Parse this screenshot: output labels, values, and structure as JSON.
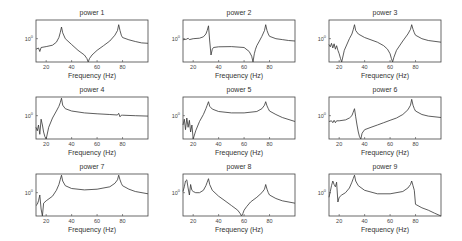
{
  "chart_data": [
    {
      "type": "line",
      "title": "power 1",
      "xlabel": "Frequency (Hz)",
      "ylabel": "",
      "ytick": "10^0",
      "xticks": [
        20,
        40,
        60,
        80
      ],
      "xlim": [
        12,
        100
      ],
      "yscale": "log",
      "x": [
        12,
        14,
        15,
        16,
        20,
        25,
        28,
        30,
        31,
        32,
        33,
        35,
        40,
        45,
        50,
        52,
        53,
        54,
        56,
        60,
        65,
        70,
        74,
        76,
        77,
        78,
        79,
        80,
        85,
        90,
        95,
        100
      ],
      "y": [
        0.55,
        0.6,
        0.45,
        0.62,
        0.66,
        0.72,
        0.85,
        1.05,
        1.25,
        1.5,
        1.25,
        1.0,
        0.75,
        0.5,
        0.3,
        0.15,
        0.0,
        0.15,
        0.3,
        0.5,
        0.7,
        0.9,
        1.15,
        1.35,
        1.6,
        1.35,
        1.15,
        1.05,
        0.95,
        0.88,
        0.82,
        0.8
      ]
    },
    {
      "type": "line",
      "title": "power 2",
      "xlabel": "Frequency (Hz)",
      "ylabel": "",
      "ytick": "10^0",
      "xticks": [
        20,
        40,
        60,
        80
      ],
      "xlim": [
        12,
        100
      ],
      "yscale": "log",
      "x": [
        12,
        15,
        16,
        17,
        20,
        25,
        28,
        30,
        31,
        32,
        33,
        34,
        35,
        36,
        40,
        50,
        60,
        64,
        66,
        67,
        68,
        69,
        70,
        72,
        74,
        76,
        77,
        78,
        79,
        80,
        85,
        90,
        95,
        100
      ],
      "y": [
        0.95,
        0.98,
        1.02,
        0.96,
        1.0,
        1.02,
        1.08,
        1.2,
        1.35,
        1.55,
        0.9,
        0.3,
        0.55,
        0.62,
        0.65,
        0.66,
        0.62,
        0.45,
        0.25,
        0.0,
        0.35,
        0.55,
        0.7,
        0.9,
        1.1,
        1.35,
        1.6,
        1.35,
        1.2,
        1.1,
        1.0,
        0.96,
        0.92,
        0.9
      ]
    },
    {
      "type": "line",
      "title": "power 3",
      "xlabel": "Frequency (Hz)",
      "ylabel": "",
      "ytick": "10^0",
      "xticks": [
        20,
        40,
        60,
        80
      ],
      "xlim": [
        12,
        100
      ],
      "yscale": "log",
      "x": [
        12,
        13,
        14,
        15,
        16,
        17,
        18,
        19,
        20,
        21,
        22,
        24,
        28,
        30,
        31,
        32,
        33,
        35,
        40,
        50,
        55,
        58,
        60,
        61,
        62,
        63,
        65,
        70,
        74,
        76,
        77,
        78,
        79,
        80,
        85,
        90,
        100
      ],
      "y": [
        0.75,
        0.65,
        0.8,
        0.6,
        0.78,
        0.55,
        0.7,
        0.5,
        0.35,
        0.15,
        0.0,
        0.5,
        1.0,
        1.2,
        1.38,
        1.6,
        1.35,
        1.2,
        1.05,
        0.85,
        0.7,
        0.55,
        0.35,
        0.15,
        0.0,
        0.2,
        0.5,
        0.9,
        1.2,
        1.4,
        1.6,
        1.4,
        1.25,
        1.15,
        1.0,
        0.92,
        0.85
      ]
    },
    {
      "type": "line",
      "title": "power 4",
      "xlabel": "Frequency (Hz)",
      "ylabel": "",
      "ytick": "10^0",
      "xticks": [
        20,
        40,
        60,
        80
      ],
      "xlim": [
        12,
        100
      ],
      "yscale": "log",
      "x": [
        12,
        13,
        14,
        15,
        16,
        17,
        18,
        19,
        20,
        22,
        25,
        28,
        30,
        31,
        32,
        33,
        35,
        40,
        50,
        60,
        70,
        76,
        77,
        78,
        79,
        80,
        90,
        100
      ],
      "y": [
        0.5,
        0.35,
        0.6,
        0.2,
        0.85,
        0.6,
        0.3,
        0.1,
        0.0,
        0.5,
        0.9,
        1.2,
        1.4,
        1.55,
        1.75,
        1.45,
        1.3,
        1.2,
        1.12,
        1.08,
        1.05,
        1.03,
        1.1,
        0.95,
        1.02,
        1.02,
        1.0,
        0.98
      ]
    },
    {
      "type": "line",
      "title": "power 5",
      "xlabel": "Frequency (Hz)",
      "ylabel": "",
      "ytick": "10^0",
      "xticks": [
        20,
        40,
        60,
        80
      ],
      "xlim": [
        12,
        100
      ],
      "yscale": "log",
      "x": [
        12,
        13,
        14,
        15,
        16,
        17,
        18,
        19,
        20,
        22,
        25,
        28,
        30,
        31,
        32,
        33,
        35,
        40,
        50,
        60,
        70,
        74,
        76,
        77,
        78,
        79,
        80,
        85,
        90,
        100
      ],
      "y": [
        0.6,
        0.85,
        0.4,
        0.9,
        0.5,
        0.8,
        0.3,
        0.6,
        0.0,
        0.35,
        0.75,
        1.05,
        1.3,
        1.45,
        1.6,
        1.4,
        1.28,
        1.18,
        1.12,
        1.12,
        1.18,
        1.3,
        1.45,
        1.6,
        1.42,
        1.3,
        1.2,
        1.05,
        0.92,
        0.75
      ]
    },
    {
      "type": "line",
      "title": "power 6",
      "xlabel": "Frequency (Hz)",
      "ylabel": "",
      "ytick": "10^0",
      "xticks": [
        20,
        40,
        60,
        80
      ],
      "xlim": [
        12,
        100
      ],
      "yscale": "log",
      "x": [
        12,
        14,
        15,
        16,
        17,
        18,
        20,
        25,
        28,
        30,
        31,
        32,
        33,
        34,
        35,
        36,
        37,
        38,
        40,
        45,
        50,
        55,
        60,
        65,
        70,
        74,
        76,
        77,
        78,
        79,
        80,
        85,
        90,
        100
      ],
      "y": [
        0.75,
        0.78,
        0.7,
        0.8,
        0.7,
        0.78,
        0.78,
        0.82,
        0.9,
        1.0,
        1.15,
        1.3,
        0.95,
        0.6,
        0.3,
        0.1,
        0.0,
        0.25,
        0.4,
        0.5,
        0.6,
        0.7,
        0.8,
        0.9,
        1.05,
        1.25,
        1.45,
        1.7,
        1.45,
        1.3,
        1.2,
        1.05,
        0.98,
        0.92
      ]
    },
    {
      "type": "line",
      "title": "power 7",
      "xlabel": "Frequency (Hz)",
      "ylabel": "",
      "ytick": "10^0",
      "xticks": [
        20,
        40,
        60,
        80
      ],
      "xlim": [
        12,
        100
      ],
      "yscale": "log",
      "x": [
        12,
        13,
        14,
        15,
        16,
        17,
        18,
        20,
        25,
        28,
        30,
        31,
        32,
        33,
        35,
        40,
        50,
        60,
        70,
        74,
        76,
        77,
        78,
        79,
        80,
        85,
        90,
        100
      ],
      "y": [
        0.45,
        0.5,
        0.65,
        0.9,
        0.3,
        0.0,
        0.55,
        0.65,
        0.85,
        1.1,
        1.35,
        1.55,
        1.75,
        1.5,
        1.3,
        1.18,
        1.12,
        1.15,
        1.25,
        1.4,
        1.55,
        1.75,
        1.55,
        1.4,
        1.3,
        1.15,
        1.05,
        0.95
      ]
    },
    {
      "type": "line",
      "title": "power 8",
      "xlabel": "Frequency (Hz)",
      "ylabel": "",
      "ytick": "10^0",
      "xticks": [
        20,
        40,
        60,
        80
      ],
      "xlim": [
        12,
        100
      ],
      "yscale": "log",
      "x": [
        12,
        13,
        14,
        15,
        16,
        17,
        18,
        19,
        20,
        22,
        25,
        28,
        30,
        31,
        32,
        33,
        35,
        40,
        45,
        50,
        55,
        57,
        58,
        59,
        60,
        62,
        65,
        70,
        74,
        76,
        77,
        78,
        79,
        80,
        85,
        90,
        100
      ],
      "y": [
        1.05,
        1.25,
        1.5,
        1.55,
        1.2,
        0.9,
        1.35,
        1.1,
        1.05,
        1.0,
        1.0,
        1.1,
        1.3,
        1.45,
        1.6,
        1.35,
        1.1,
        0.85,
        0.65,
        0.45,
        0.25,
        0.1,
        0.0,
        0.1,
        0.25,
        0.4,
        0.6,
        0.8,
        1.0,
        1.15,
        1.35,
        1.15,
        1.0,
        0.9,
        0.75,
        0.65,
        0.55
      ]
    },
    {
      "type": "line",
      "title": "power 9",
      "xlabel": "Frequency (Hz)",
      "ylabel": "",
      "ytick": "10^0",
      "xticks": [
        20,
        40,
        60,
        80
      ],
      "xlim": [
        12,
        100
      ],
      "yscale": "log",
      "x": [
        12,
        13,
        14,
        15,
        16,
        17,
        18,
        19,
        20,
        22,
        25,
        28,
        30,
        31,
        32,
        33,
        35,
        40,
        50,
        60,
        70,
        74,
        76,
        77,
        78,
        79,
        80,
        85,
        90,
        95,
        100
      ],
      "y": [
        0.8,
        1.05,
        1.3,
        1.5,
        1.35,
        1.25,
        1.45,
        0.6,
        0.8,
        0.9,
        1.0,
        1.2,
        1.45,
        1.6,
        1.75,
        1.5,
        1.3,
        1.1,
        0.95,
        0.95,
        1.05,
        1.2,
        1.35,
        1.5,
        1.3,
        1.1,
        0.5,
        0.35,
        0.25,
        0.12,
        0.0
      ]
    }
  ],
  "panels": [
    {
      "title": "power 1",
      "xlabel": "Frequency (Hz)",
      "ytick": "10",
      "ytick_exp": "0",
      "xticks": [
        "20",
        "40",
        "60",
        "80"
      ]
    },
    {
      "title": "power 2",
      "xlabel": "Frequency (Hz)",
      "ytick": "10",
      "ytick_exp": "0",
      "xticks": [
        "20",
        "40",
        "60",
        "80"
      ]
    },
    {
      "title": "power 3",
      "xlabel": "Frequency (Hz)",
      "ytick": "10",
      "ytick_exp": "0",
      "xticks": [
        "20",
        "40",
        "60",
        "80"
      ]
    },
    {
      "title": "power 4",
      "xlabel": "Frequency (Hz)",
      "ytick": "10",
      "ytick_exp": "0",
      "xticks": [
        "20",
        "40",
        "60",
        "80"
      ]
    },
    {
      "title": "power 5",
      "xlabel": "Frequency (Hz)",
      "ytick": "10",
      "ytick_exp": "0",
      "xticks": [
        "20",
        "40",
        "60",
        "80"
      ]
    },
    {
      "title": "power 6",
      "xlabel": "Frequency (Hz)",
      "ytick": "10",
      "ytick_exp": "0",
      "xticks": [
        "20",
        "40",
        "60",
        "80"
      ]
    },
    {
      "title": "power 7",
      "xlabel": "Frequency (Hz)",
      "ytick": "10",
      "ytick_exp": "0",
      "xticks": [
        "20",
        "40",
        "60",
        "80"
      ]
    },
    {
      "title": "power 8",
      "xlabel": "Frequency (Hz)",
      "ytick": "10",
      "ytick_exp": "0",
      "xticks": [
        "20",
        "40",
        "60",
        "80"
      ]
    },
    {
      "title": "power 9",
      "xlabel": "Frequency (Hz)",
      "ytick": "10",
      "ytick_exp": "0",
      "xticks": [
        "20",
        "40",
        "60",
        "80"
      ]
    }
  ],
  "colors": {
    "line": "#333333",
    "axes": "#444444"
  }
}
